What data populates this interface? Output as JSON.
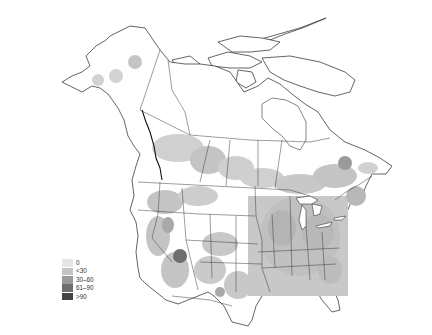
{
  "map": {
    "region": "North America (Canada, United States, Mexico)",
    "style": "grayscale choropleth density map"
  },
  "legend": {
    "items": [
      {
        "label": "0",
        "color": "#e6e6e6"
      },
      {
        "label": "<30",
        "color": "#c4c4c4"
      },
      {
        "label": "30–60",
        "color": "#9a9a9a"
      },
      {
        "label": "61–90",
        "color": "#6e6e6e"
      },
      {
        "label": ">90",
        "color": "#444444"
      }
    ]
  },
  "colors": {
    "background": "#ffffff",
    "outline": "#222222",
    "low": "#c4c4c4",
    "medium": "#9a9a9a",
    "high": "#6e6e6e"
  }
}
